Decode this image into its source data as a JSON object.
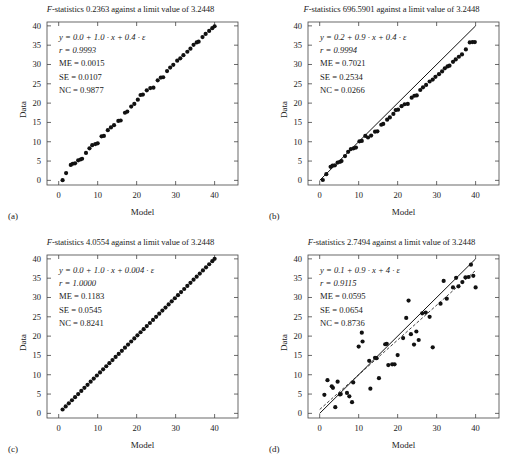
{
  "figure": {
    "axis_labels": {
      "x": "Model",
      "y": "Data"
    },
    "x_ticks": [
      "0",
      "10",
      "20",
      "30",
      "40"
    ],
    "y_ticks": [
      "0",
      "5",
      "10",
      "15",
      "20",
      "25",
      "30",
      "35",
      "40"
    ],
    "colors": {
      "ink": "#1a1a1a",
      "marker": "#111111",
      "line": "#111111",
      "frame": "#444444"
    }
  },
  "panels": [
    {
      "letter": "(a)",
      "title_prefix": "F",
      "title": "-statistics 0.2363 against a limit value of 3.2448",
      "f_statistic": "0.2363",
      "limit_value": "3.2448",
      "annotations": {
        "equation": "y = 0.0 + 1.0 · x + 0.4 · ε",
        "r": "r = 0.9993",
        "me": "ME = 0.0015",
        "se": "SE = 0.0107",
        "nc": "NC = 0.9877"
      }
    },
    {
      "letter": "(b)",
      "title_prefix": "F",
      "title": "-statistics 696.5901 against a limit value of 3.2448",
      "f_statistic": "696.5901",
      "limit_value": "3.2448",
      "annotations": {
        "equation": "y = 0.2 + 0.9 · x + 0.4 · ε",
        "r": "r = 0.9994",
        "me": "ME = 0.7021",
        "se": "SE = 0.2534",
        "nc": "NC = 0.0266"
      }
    },
    {
      "letter": "(c)",
      "title_prefix": "F",
      "title": "-statistics 4.0554 against a limit value of 3.2448",
      "f_statistic": "4.0554",
      "limit_value": "3.2448",
      "annotations": {
        "equation": "y = 0.0 + 1.0 · x + 0.004 · ε",
        "r": "r = 1.0000",
        "me": "ME = 0.1183",
        "se": "SE = 0.0545",
        "nc": "NC = 0.8241"
      }
    },
    {
      "letter": "(d)",
      "title_prefix": "F",
      "title": "-statistics 2.7494 against a limit value of 3.2448",
      "f_statistic": "2.7494",
      "limit_value": "3.2448",
      "annotations": {
        "equation": "y = 0.1 + 0.9 · x + 4 · ε",
        "r": "r = 0.9115",
        "me": "ME = 0.0595",
        "se": "SE = 0.0654",
        "nc": "NC = 0.8736"
      }
    }
  ],
  "chart_data": [
    {
      "type": "scatter",
      "panel": "(a)",
      "title": "F-statistics 0.2363 against a limit value of 3.2448",
      "xlabel": "Model",
      "ylabel": "Data",
      "xlim": [
        -3,
        46
      ],
      "ylim": [
        -1.2,
        41
      ],
      "grid": false,
      "legend": "none",
      "model_equation": "y = 0.0 + 1.0 * x + 0.4 * eps",
      "reference_line": {
        "slope": 1,
        "intercept": 0,
        "style": "solid",
        "visible": false
      },
      "points": [
        [
          1.0,
          0.05
        ],
        [
          1.9,
          1.9
        ],
        [
          3.1,
          4.0
        ],
        [
          3.6,
          4.3
        ],
        [
          4.2,
          4.4
        ],
        [
          5.0,
          5.2
        ],
        [
          5.6,
          5.4
        ],
        [
          6.0,
          5.6
        ],
        [
          7.0,
          7.1
        ],
        [
          7.9,
          8.3
        ],
        [
          8.6,
          9.1
        ],
        [
          9.4,
          9.4
        ],
        [
          10.0,
          9.6
        ],
        [
          11.0,
          11.4
        ],
        [
          11.6,
          11.5
        ],
        [
          12.6,
          13.0
        ],
        [
          13.4,
          13.7
        ],
        [
          14.2,
          14.3
        ],
        [
          15.3,
          15.4
        ],
        [
          15.9,
          15.5
        ],
        [
          17.0,
          17.5
        ],
        [
          17.6,
          17.8
        ],
        [
          18.6,
          19.1
        ],
        [
          19.4,
          19.8
        ],
        [
          20.3,
          20.9
        ],
        [
          21.0,
          22.1
        ],
        [
          21.6,
          22.2
        ],
        [
          22.6,
          23.3
        ],
        [
          23.5,
          23.9
        ],
        [
          24.3,
          24.0
        ],
        [
          25.4,
          25.9
        ],
        [
          26.2,
          26.6
        ],
        [
          26.8,
          26.7
        ],
        [
          27.8,
          28.3
        ],
        [
          28.6,
          29.2
        ],
        [
          29.4,
          29.9
        ],
        [
          30.4,
          31.0
        ],
        [
          31.2,
          31.6
        ],
        [
          32.0,
          32.4
        ],
        [
          33.0,
          33.3
        ],
        [
          33.8,
          34.1
        ],
        [
          34.6,
          35.1
        ],
        [
          35.4,
          35.7
        ],
        [
          35.9,
          35.9
        ],
        [
          36.9,
          37.1
        ],
        [
          37.7,
          37.9
        ],
        [
          38.6,
          38.7
        ],
        [
          39.4,
          39.4
        ],
        [
          40.0,
          39.9
        ]
      ]
    },
    {
      "type": "scatter",
      "panel": "(b)",
      "title": "F-statistics 696.5901 against a limit value of 3.2448",
      "xlabel": "Model",
      "ylabel": "Data",
      "xlim": [
        -3,
        46
      ],
      "ylim": [
        -1.2,
        41
      ],
      "grid": false,
      "legend": "none",
      "model_equation": "y = 0.2 + 0.9 * x + 0.4 * eps",
      "reference_line": {
        "slope": 1,
        "intercept": 0,
        "style": "solid",
        "visible": true
      },
      "points": [
        [
          0.8,
          0.1
        ],
        [
          1.7,
          1.6
        ],
        [
          2.8,
          3.5
        ],
        [
          3.3,
          3.8
        ],
        [
          3.9,
          3.9
        ],
        [
          4.6,
          4.6
        ],
        [
          5.2,
          4.8
        ],
        [
          5.6,
          5.0
        ],
        [
          6.5,
          6.3
        ],
        [
          7.3,
          7.4
        ],
        [
          8.0,
          8.1
        ],
        [
          8.7,
          8.3
        ],
        [
          9.3,
          8.5
        ],
        [
          10.2,
          10.1
        ],
        [
          10.8,
          10.2
        ],
        [
          11.7,
          11.5
        ],
        [
          12.4,
          11.1
        ],
        [
          13.2,
          11.6
        ],
        [
          14.2,
          12.6
        ],
        [
          14.8,
          12.7
        ],
        [
          15.8,
          14.4
        ],
        [
          16.3,
          14.6
        ],
        [
          17.3,
          15.7
        ],
        [
          18.0,
          16.3
        ],
        [
          18.9,
          17.2
        ],
        [
          19.5,
          18.2
        ],
        [
          20.1,
          18.3
        ],
        [
          21.0,
          19.2
        ],
        [
          21.8,
          19.7
        ],
        [
          22.6,
          19.8
        ],
        [
          23.6,
          21.4
        ],
        [
          24.3,
          21.9
        ],
        [
          24.9,
          22.0
        ],
        [
          25.8,
          23.4
        ],
        [
          26.5,
          24.1
        ],
        [
          27.3,
          24.7
        ],
        [
          28.2,
          25.6
        ],
        [
          29.0,
          26.1
        ],
        [
          29.7,
          26.8
        ],
        [
          30.6,
          27.5
        ],
        [
          31.4,
          28.2
        ],
        [
          32.1,
          29.0
        ],
        [
          32.8,
          29.5
        ],
        [
          33.3,
          29.7
        ],
        [
          34.2,
          30.7
        ],
        [
          34.9,
          31.3
        ],
        [
          35.7,
          32.0
        ],
        [
          36.5,
          32.6
        ],
        [
          37.5,
          33.9
        ],
        [
          38.5,
          35.7
        ],
        [
          39.2,
          35.8
        ],
        [
          39.8,
          35.8
        ]
      ]
    },
    {
      "type": "scatter",
      "panel": "(c)",
      "title": "F-statistics 4.0554 against a limit value of 3.2448",
      "xlabel": "Model",
      "ylabel": "Data",
      "xlim": [
        -3,
        46
      ],
      "ylim": [
        -1.2,
        41
      ],
      "grid": false,
      "legend": "none",
      "model_equation": "y = 0.0 + 1.0 * x + 0.004 * eps",
      "reference_line": {
        "slope": 1,
        "intercept": 0,
        "style": "solid",
        "visible": false
      },
      "points": [
        [
          1.0,
          1.0
        ],
        [
          1.8,
          1.8
        ],
        [
          2.6,
          2.6
        ],
        [
          3.4,
          3.4
        ],
        [
          4.2,
          4.2
        ],
        [
          5.0,
          5.0
        ],
        [
          5.8,
          5.8
        ],
        [
          6.6,
          6.6
        ],
        [
          7.4,
          7.4
        ],
        [
          8.2,
          8.2
        ],
        [
          9.0,
          9.0
        ],
        [
          9.8,
          9.8
        ],
        [
          10.6,
          10.6
        ],
        [
          11.4,
          11.4
        ],
        [
          12.2,
          12.2
        ],
        [
          13.0,
          13.0
        ],
        [
          13.8,
          13.8
        ],
        [
          14.6,
          14.6
        ],
        [
          15.4,
          15.4
        ],
        [
          16.2,
          16.2
        ],
        [
          17.0,
          17.0
        ],
        [
          17.8,
          17.8
        ],
        [
          18.6,
          18.6
        ],
        [
          19.4,
          19.4
        ],
        [
          20.2,
          20.2
        ],
        [
          21.0,
          21.0
        ],
        [
          21.8,
          21.8
        ],
        [
          22.6,
          22.6
        ],
        [
          23.4,
          23.4
        ],
        [
          24.2,
          24.2
        ],
        [
          25.0,
          25.0
        ],
        [
          25.8,
          25.8
        ],
        [
          26.6,
          26.6
        ],
        [
          27.4,
          27.4
        ],
        [
          28.2,
          28.2
        ],
        [
          29.0,
          29.0
        ],
        [
          29.8,
          29.8
        ],
        [
          30.6,
          30.6
        ],
        [
          31.4,
          31.4
        ],
        [
          32.2,
          32.2
        ],
        [
          33.0,
          33.0
        ],
        [
          33.8,
          33.8
        ],
        [
          34.6,
          34.6
        ],
        [
          35.4,
          35.4
        ],
        [
          36.2,
          36.2
        ],
        [
          37.0,
          37.0
        ],
        [
          37.8,
          37.8
        ],
        [
          38.6,
          38.6
        ],
        [
          39.4,
          39.4
        ],
        [
          40.0,
          40.0
        ]
      ]
    },
    {
      "type": "scatter",
      "panel": "(d)",
      "title": "F-statistics 2.7494 against a limit value of 3.2448",
      "xlabel": "Model",
      "ylabel": "Data",
      "xlim": [
        -3,
        46
      ],
      "ylim": [
        -1.2,
        41
      ],
      "grid": false,
      "legend": "none",
      "model_equation": "y = 0.1 + 0.9 * x + 4 * eps",
      "reference_line": {
        "slope": 1,
        "intercept": 0,
        "style": "solid",
        "visible": true
      },
      "regression_line": {
        "slope": 0.9,
        "intercept": 1.0,
        "style": "dashed",
        "visible": true
      },
      "points": [
        [
          1.2,
          4.8
        ],
        [
          2.0,
          8.6
        ],
        [
          3.1,
          7.0
        ],
        [
          3.4,
          6.6
        ],
        [
          4.0,
          1.6
        ],
        [
          4.6,
          8.2
        ],
        [
          5.2,
          4.9
        ],
        [
          5.4,
          5.0
        ],
        [
          7.0,
          5.3
        ],
        [
          7.6,
          4.4
        ],
        [
          8.3,
          2.9
        ],
        [
          8.6,
          8.0
        ],
        [
          10.0,
          17.3
        ],
        [
          10.8,
          20.9
        ],
        [
          11.0,
          18.6
        ],
        [
          12.7,
          13.6
        ],
        [
          13.0,
          6.4
        ],
        [
          14.2,
          14.4
        ],
        [
          14.6,
          14.3
        ],
        [
          15.2,
          9.1
        ],
        [
          16.8,
          17.9
        ],
        [
          17.2,
          18.0
        ],
        [
          17.6,
          12.5
        ],
        [
          18.6,
          12.7
        ],
        [
          19.2,
          12.7
        ],
        [
          20.0,
          15.1
        ],
        [
          21.4,
          19.5
        ],
        [
          22.2,
          24.7
        ],
        [
          22.8,
          29.2
        ],
        [
          23.4,
          20.5
        ],
        [
          24.2,
          17.8
        ],
        [
          24.8,
          21.2
        ],
        [
          25.4,
          19.0
        ],
        [
          26.3,
          25.9
        ],
        [
          27.2,
          26.1
        ],
        [
          28.2,
          25.0
        ],
        [
          29.0,
          17.1
        ],
        [
          31.0,
          28.4
        ],
        [
          31.8,
          34.3
        ],
        [
          32.6,
          29.7
        ],
        [
          34.2,
          32.6
        ],
        [
          35.0,
          35.1
        ],
        [
          35.6,
          32.9
        ],
        [
          36.6,
          34.0
        ],
        [
          37.4,
          35.2
        ],
        [
          38.2,
          35.3
        ],
        [
          38.8,
          38.5
        ],
        [
          39.4,
          35.6
        ],
        [
          40.0,
          32.6
        ]
      ]
    }
  ]
}
